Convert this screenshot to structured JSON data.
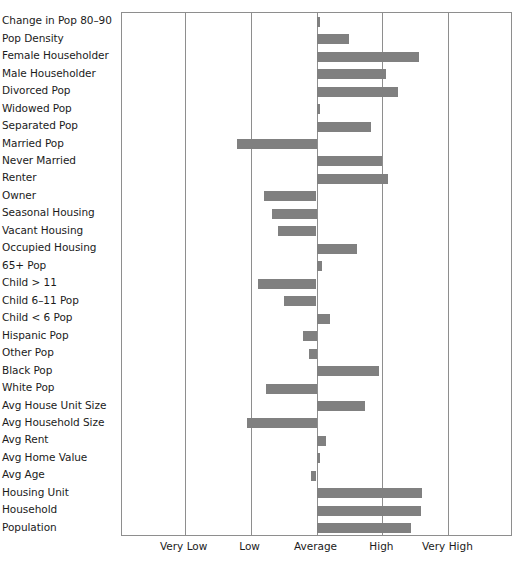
{
  "chart_data": {
    "type": "bar",
    "orientation": "horizontal",
    "title": "",
    "subtitle": "",
    "xlabel": "",
    "ylabel": "",
    "grid": true,
    "legend": null,
    "baseline_category": "Average",
    "xtick_labels": [
      "Very Low",
      "Low",
      "Average",
      "High",
      "Very High"
    ],
    "xtick_values": [
      -2,
      -1,
      0,
      1,
      2
    ],
    "xlim": [
      -2.95,
      2.98
    ],
    "categories": [
      "Change in Pop 80–90",
      "Pop Density",
      "Female Householder",
      "Male Householder",
      "Divorced Pop",
      "Widowed Pop",
      "Separated Pop",
      "Married Pop",
      "Never Married",
      "Renter",
      "Owner",
      "Seasonal Housing",
      "Vacant Housing",
      "Occupied Housing",
      "65+ Pop",
      "Child > 11",
      "Child 6–11 Pop",
      "Child < 6 Pop",
      "Hispanic Pop",
      "Other Pop",
      "Black Pop",
      "White Pop",
      "Avg House Unit Size",
      "Avg Household Size",
      "Avg Rent",
      "Avg Home Value",
      "Avg Age",
      "Housing Unit",
      "Household",
      "Population"
    ],
    "values": [
      0.05,
      0.5,
      1.56,
      1.05,
      1.23,
      0.05,
      0.83,
      -1.21,
      1.0,
      1.09,
      -0.79,
      -0.68,
      -0.59,
      0.62,
      0.09,
      -0.89,
      -0.5,
      0.21,
      -0.21,
      -0.12,
      0.95,
      -0.76,
      0.74,
      -1.06,
      0.15,
      0.06,
      -0.09,
      1.6,
      1.59,
      1.44
    ],
    "bar_color": "#808080",
    "axis_color": "#8e8e8e",
    "background_color": "#ffffff"
  }
}
